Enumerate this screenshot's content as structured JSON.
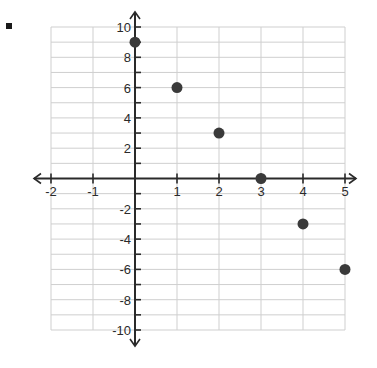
{
  "bullet_marker": "square-bullet",
  "chart_data": {
    "type": "scatter",
    "title": "",
    "xlabel": "",
    "ylabel": "",
    "xlim": [
      -2,
      5
    ],
    "ylim": [
      -10,
      10
    ],
    "grid": true,
    "x_ticks": [
      -2,
      -1,
      1,
      2,
      3,
      4,
      5
    ],
    "x_tick_labels": [
      "-2",
      "-1",
      "1",
      "2",
      "3",
      "4",
      "5"
    ],
    "y_ticks": [
      10,
      8,
      6,
      4,
      2,
      -2,
      -4,
      -6,
      -8,
      -10
    ],
    "y_tick_labels": [
      "10",
      "8",
      "6",
      "4",
      "2",
      "-2",
      "-4",
      "-6",
      "-8",
      "-10"
    ],
    "points": [
      {
        "x": 0,
        "y": 9
      },
      {
        "x": 1,
        "y": 6
      },
      {
        "x": 2,
        "y": 3
      },
      {
        "x": 3,
        "y": 0
      },
      {
        "x": 4,
        "y": -3
      },
      {
        "x": 5,
        "y": -6
      }
    ]
  },
  "colors": {
    "grid": "#cfcfcf",
    "axis": "#2a2a2a",
    "point": "#3a3a3a"
  }
}
